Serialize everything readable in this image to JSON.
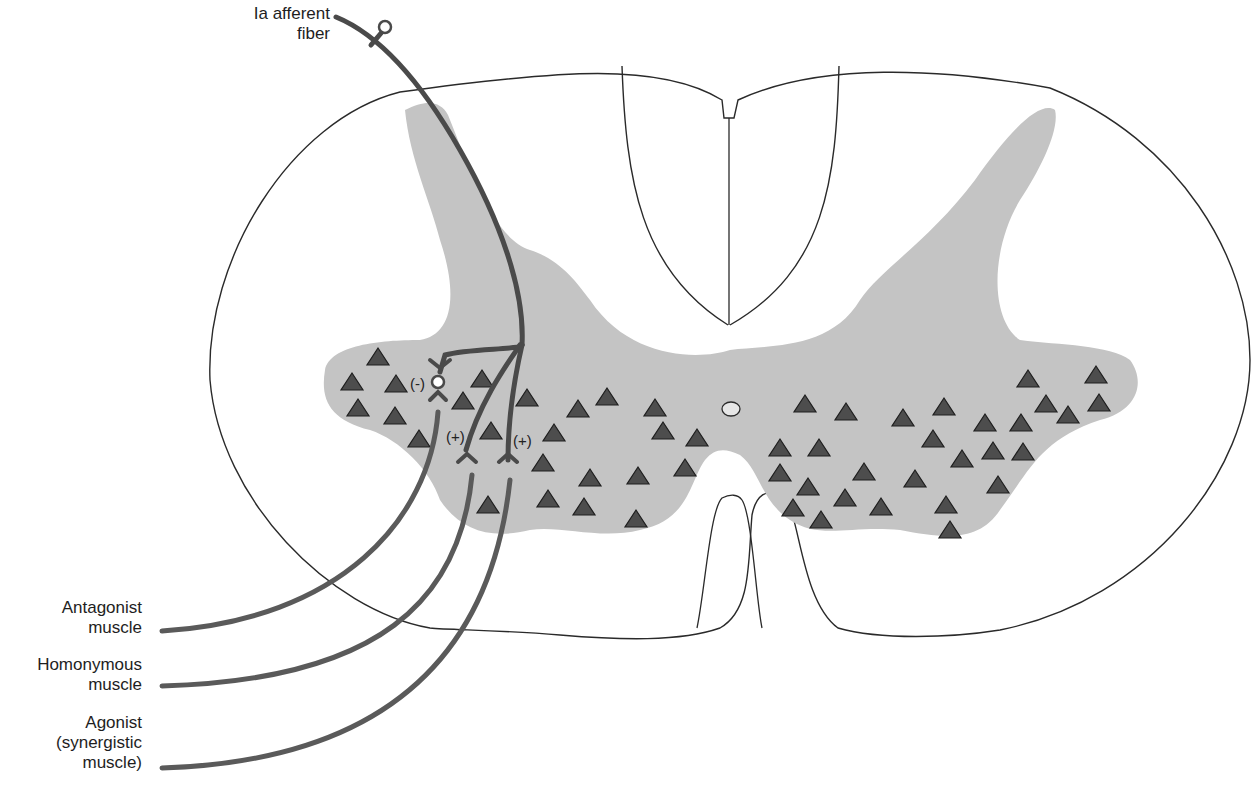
{
  "labels": {
    "afferent": "Ia afferent\nfiber",
    "antagonist": "Antagonist\nmuscle",
    "homonymous": "Homonymous\nmuscle",
    "agonist": "Agonist\n(synergistic\nmuscle)"
  },
  "synapse_signs": {
    "inhibitory": "(-)",
    "excitatory_homonymous": "(+)",
    "excitatory_agonist": "(+)"
  },
  "colors": {
    "gray_matter": "#c4c4c4",
    "motor_neuron": "#4d4d4d",
    "fiber": "#4a4a4a",
    "outline": "#2a2a2a",
    "background": "#ffffff"
  },
  "motor_neurons_left": [
    [
      378,
      358
    ],
    [
      352,
      383
    ],
    [
      396,
      385
    ],
    [
      358,
      409
    ],
    [
      395,
      417
    ],
    [
      419,
      440
    ],
    [
      463,
      402
    ],
    [
      482,
      380
    ],
    [
      527,
      399
    ],
    [
      491,
      432
    ],
    [
      554,
      434
    ],
    [
      543,
      464
    ],
    [
      578,
      410
    ],
    [
      607,
      398
    ],
    [
      655,
      409
    ],
    [
      663,
      432
    ],
    [
      697,
      439
    ],
    [
      590,
      479
    ],
    [
      638,
      477
    ],
    [
      685,
      469
    ],
    [
      548,
      500
    ],
    [
      584,
      508
    ],
    [
      636,
      520
    ],
    [
      488,
      506
    ]
  ],
  "motor_neurons_right": [
    [
      805,
      405
    ],
    [
      846,
      413
    ],
    [
      903,
      419
    ],
    [
      944,
      408
    ],
    [
      985,
      424
    ],
    [
      1021,
      424
    ],
    [
      1028,
      380
    ],
    [
      1046,
      405
    ],
    [
      1068,
      416
    ],
    [
      1096,
      376
    ],
    [
      1099,
      404
    ],
    [
      780,
      449
    ],
    [
      819,
      449
    ],
    [
      780,
      474
    ],
    [
      808,
      488
    ],
    [
      864,
      473
    ],
    [
      933,
      440
    ],
    [
      962,
      460
    ],
    [
      993,
      452
    ],
    [
      1023,
      453
    ],
    [
      915,
      480
    ],
    [
      845,
      499
    ],
    [
      793,
      509
    ],
    [
      821,
      521
    ],
    [
      881,
      508
    ],
    [
      946,
      506
    ],
    [
      998,
      486
    ],
    [
      950,
      531
    ]
  ]
}
